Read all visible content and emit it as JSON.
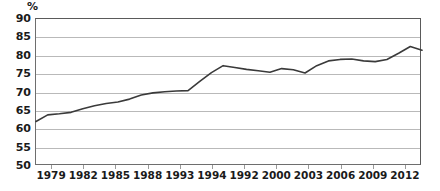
{
  "chart_data": {
    "type": "line",
    "title": "",
    "xlabel": "",
    "ylabel": "%",
    "ylim": [
      50,
      90
    ],
    "ytick_step": 5,
    "yticks": [
      90,
      85,
      80,
      75,
      70,
      65,
      60,
      55,
      50
    ],
    "grid": true,
    "legend": "none",
    "line_color": "#3a3a3a",
    "grid_color": "#b9b9b9",
    "axis_color": "#6e6e6e",
    "categories": [
      "1979",
      "1982",
      "1985",
      "1988",
      "1993",
      "1994",
      "1992",
      "2000",
      "2003",
      "2006",
      "2009",
      "2012"
    ],
    "series": [
      {
        "name": "",
        "x": [
          1979,
          1980,
          1981,
          1982,
          1983,
          1984,
          1985,
          1986,
          1987,
          1988,
          1989,
          1990,
          1991,
          1992,
          1993,
          1994,
          1995,
          1996,
          1997,
          1998,
          1999,
          2000,
          2001,
          2002,
          2003,
          2004,
          2005,
          2006,
          2007,
          2008,
          2009,
          2010,
          2011,
          2012
        ],
        "values": [
          62.1,
          63.9,
          64.2,
          64.6,
          65.6,
          66.4,
          67.0,
          67.4,
          68.2,
          69.3,
          69.9,
          70.2,
          70.4,
          70.5,
          73.0,
          75.4,
          77.3,
          76.8,
          76.3,
          75.9,
          75.5,
          76.5,
          76.2,
          75.3,
          77.3,
          78.6,
          79.0,
          79.1,
          78.6,
          78.4,
          79.0,
          80.7,
          82.5,
          81.5
        ]
      }
    ]
  },
  "axis": {
    "unit_label": "%"
  }
}
